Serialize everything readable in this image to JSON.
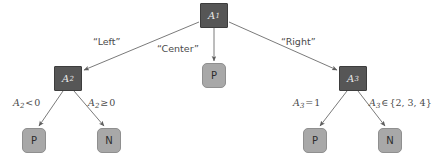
{
  "diagram": {
    "type": "decision-tree",
    "colors": {
      "internal_node_fill": "#565656",
      "internal_node_border": "#3d3d3d",
      "internal_node_text": "#e9e9e9",
      "leaf_node_fill": "#a8a8a8",
      "leaf_node_border": "#8f8f8f",
      "leaf_node_text": "#2c2c2c",
      "edge_stroke": "#6b6b6b",
      "label_text": "#4a4a4a",
      "background": "#ffffff"
    },
    "nodes": [
      {
        "id": "A1",
        "kind": "internal",
        "var": "A",
        "sub": "1",
        "x": 200,
        "y": 3,
        "w": 28,
        "h": 25
      },
      {
        "id": "A2",
        "kind": "internal",
        "var": "A",
        "sub": "2",
        "x": 54,
        "y": 66,
        "w": 28,
        "h": 25
      },
      {
        "id": "A3",
        "kind": "internal",
        "var": "A",
        "sub": "3",
        "x": 339,
        "y": 66,
        "w": 28,
        "h": 25
      },
      {
        "id": "leaf-center-p",
        "kind": "leaf",
        "label": "P",
        "x": 202,
        "y": 63,
        "w": 24,
        "h": 25
      },
      {
        "id": "leaf-a2-p",
        "kind": "leaf",
        "label": "P",
        "x": 22,
        "y": 128,
        "w": 24,
        "h": 25
      },
      {
        "id": "leaf-a2-n",
        "kind": "leaf",
        "label": "N",
        "x": 97,
        "y": 128,
        "w": 24,
        "h": 25
      },
      {
        "id": "leaf-a3-p",
        "kind": "leaf",
        "label": "P",
        "x": 303,
        "y": 128,
        "w": 24,
        "h": 25
      },
      {
        "id": "leaf-a3-n",
        "kind": "leaf",
        "label": "N",
        "x": 378,
        "y": 128,
        "w": 24,
        "h": 25
      }
    ],
    "edges": [
      {
        "id": "edge-a1-a2",
        "from": "A1",
        "to": "A2",
        "x1": 200,
        "y1": 22,
        "x2": 82,
        "y2": 70
      },
      {
        "id": "edge-a1-center",
        "from": "A1",
        "to": "leaf-center-p",
        "x1": 214,
        "y1": 28,
        "x2": 214,
        "y2": 62
      },
      {
        "id": "edge-a1-a3",
        "from": "A1",
        "to": "A3",
        "x1": 228,
        "y1": 22,
        "x2": 339,
        "y2": 70
      },
      {
        "id": "edge-a2-p",
        "from": "A2",
        "to": "leaf-a2-p",
        "x1": 62,
        "y1": 91,
        "x2": 40,
        "y2": 127
      },
      {
        "id": "edge-a2-n",
        "from": "A2",
        "to": "leaf-a2-n",
        "x1": 75,
        "y1": 91,
        "x2": 103,
        "y2": 127
      },
      {
        "id": "edge-a3-p",
        "from": "A3",
        "to": "leaf-a3-p",
        "x1": 346,
        "y1": 91,
        "x2": 321,
        "y2": 127
      },
      {
        "id": "edge-a3-n",
        "from": "A3",
        "to": "leaf-a3-n",
        "x1": 359,
        "y1": 91,
        "x2": 384,
        "y2": 127
      }
    ],
    "edge_labels": {
      "left": "“Left”",
      "center": "“Center”",
      "right": "“Right”",
      "a2_lt": {
        "var": "A",
        "sub": "2",
        "op": "<",
        "value": "0"
      },
      "a2_ge": {
        "var": "A",
        "sub": "2",
        "op": "≥",
        "value": "0"
      },
      "a3_eq": {
        "var": "A",
        "sub": "3",
        "op": "=",
        "value": "1"
      },
      "a3_in": {
        "var": "A",
        "sub": "3",
        "op": "∈",
        "value": "{2, 3, 4}"
      }
    }
  }
}
